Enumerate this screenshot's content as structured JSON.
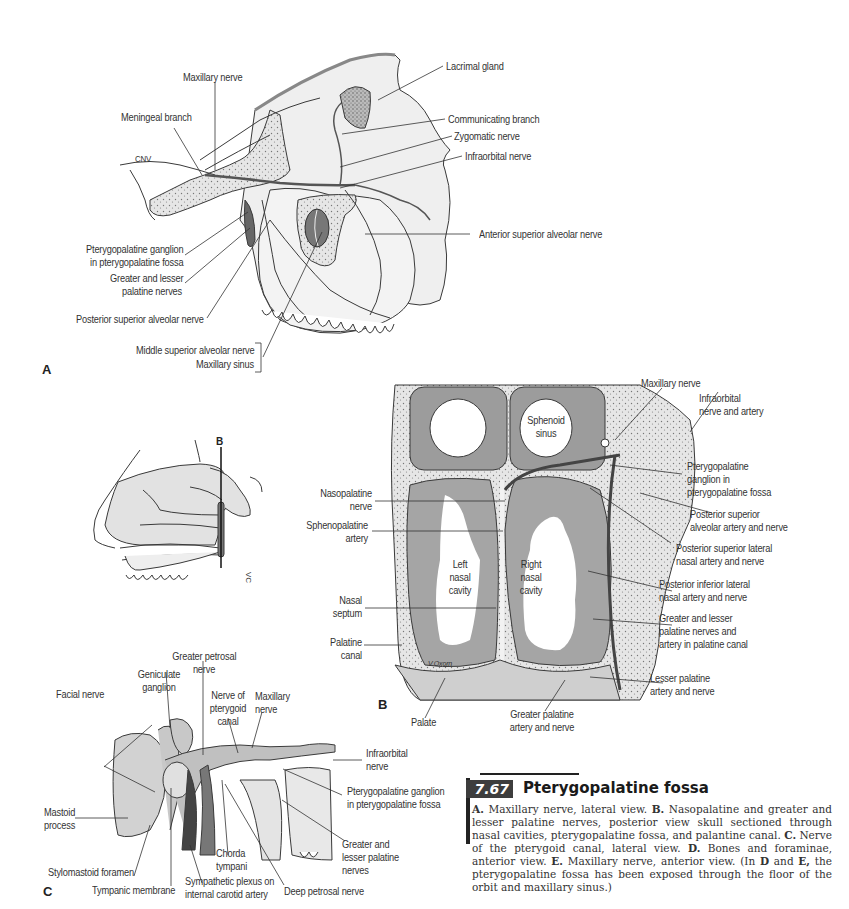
{
  "figure": {
    "number": "7.67",
    "title": "Pterygopalatine fossa",
    "caption": [
      {
        "bold": "A.",
        "text": " Maxillary nerve, lateral view. "
      },
      {
        "bold": "B.",
        "text": " Nasopalatine and greater and lesser palatine nerves, posterior view skull sectioned through nasal cavities, pterygopalatine fossa, and palantine canal. "
      },
      {
        "bold": "C.",
        "text": " Nerve of the pterygoid canal, lateral view. "
      },
      {
        "bold": "D.",
        "text": " Bones and foraminae, anterior view. "
      },
      {
        "bold": "E.",
        "text": " Maxillary nerve, anterior view. (In "
      },
      {
        "bold": "D",
        "text": " and "
      },
      {
        "bold": "E,",
        "text": " the pterygopalatine fossa has been exposed through the floor of the orbit and maxillary sinus.)"
      }
    ]
  },
  "panel_a": {
    "letter": "A",
    "labels": {
      "maxillary_nerve": "Maxillary nerve",
      "meningeal_branch": "Meningeal branch",
      "cnv": "CNV",
      "lacrimal_gland": "Lacrimal gland",
      "communicating_branch": "Communicating branch",
      "zygomatic_nerve": "Zygomatic nerve",
      "infraorbital_nerve": "Infraorbital nerve",
      "anterior_superior_alveolar_nerve": "Anterior superior alveolar nerve",
      "pterygopalatine_ganglion_1": "Pterygopalatine ganglion",
      "pterygopalatine_ganglion_2": "in pterygopalatine fossa",
      "greater_lesser_palatine_1": "Greater and lesser",
      "greater_lesser_palatine_2": "palatine nerves",
      "posterior_superior_alveolar_nerve": "Posterior superior alveolar nerve",
      "middle_superior_alveolar_nerve": "Middle superior alveolar nerve",
      "maxillary_sinus": "Maxillary sinus"
    }
  },
  "panel_b_inset": {
    "marker": "B",
    "signature": "VC"
  },
  "panel_b": {
    "letter": "B",
    "signature": "V.Oxorn",
    "labels": {
      "maxillary_nerve": "Maxillary nerve",
      "infraorbital_1": "Infraorbital",
      "infraorbital_2": "nerve and artery",
      "sphenoid_1": "Sphenoid",
      "sphenoid_2": "sinus",
      "ptg_ganglion_1": "Pterygopalatine",
      "ptg_ganglion_2": "ganglion in",
      "ptg_ganglion_3": "pterygopalatine fossa",
      "nasopalatine_1": "Nasopalatine",
      "nasopalatine_2": "nerve",
      "post_sup_alv_1": "Posterior superior",
      "post_sup_alv_2": "alveolar artery and nerve",
      "sphenopalatine_1": "Sphenopalatine",
      "sphenopalatine_2": "artery",
      "post_sup_lat_1": "Posterior superior lateral",
      "post_sup_lat_2": "nasal artery and nerve",
      "left_nasal_1": "Left",
      "left_nasal_2": "nasal",
      "left_nasal_3": "cavity",
      "right_nasal_1": "Right",
      "right_nasal_2": "nasal",
      "right_nasal_3": "cavity",
      "post_inf_lat_1": "Posterior inferior lateral",
      "post_inf_lat_2": "nasal artery and nerve",
      "nasal_septum_1": "Nasal",
      "nasal_septum_2": "septum",
      "gl_palatine_1": "Greater and lesser",
      "gl_palatine_2": "palatine nerves and",
      "gl_palatine_3": "artery in palatine canal",
      "palatine_canal_1": "Palatine",
      "palatine_canal_2": "canal",
      "lesser_palatine_1": "Lesser palatine",
      "lesser_palatine_2": "artery and nerve",
      "palate": "Palate",
      "greater_palatine_1": "Greater palatine",
      "greater_palatine_2": "artery and nerve"
    }
  },
  "panel_c": {
    "letter": "C",
    "labels": {
      "greater_petrosal_1": "Greater petrosal",
      "greater_petrosal_2": "nerve",
      "geniculate_1": "Geniculate",
      "geniculate_2": "ganglion",
      "facial_nerve": "Facial nerve",
      "nerve_pterygoid_1": "Nerve of",
      "nerve_pterygoid_2": "pterygoid",
      "nerve_pterygoid_3": "canal",
      "maxillary_1": "Maxillary",
      "maxillary_2": "nerve",
      "infraorbital_1": "Infraorbital",
      "infraorbital_2": "nerve",
      "ptg_ganglion_1": "Pterygopalatine ganglion",
      "ptg_ganglion_2": "in pterygopalatine fossa",
      "mastoid_1": "Mastoid",
      "mastoid_2": "process",
      "chorda_1": "Chorda",
      "chorda_2": "tympani",
      "greater_lesser_1": "Greater and",
      "greater_lesser_2": "lesser palatine",
      "greater_lesser_3": "nerves",
      "stylomastoid": "Stylomastoid foramen",
      "tympanic": "Tympanic membrane",
      "sympathetic_1": "Sympathetic plexus on",
      "sympathetic_2": "internal carotid artery",
      "deep_petrosal": "Deep petrosal nerve"
    }
  },
  "colors": {
    "bone_fill": "#d9d9d9",
    "soft_fill": "#a9a9a9",
    "line": "#3a3a3a",
    "figure_badge": "#3d3d3d"
  }
}
